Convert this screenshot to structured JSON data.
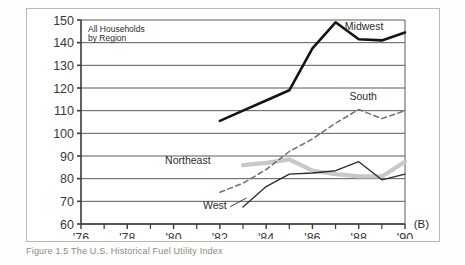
{
  "figure": {
    "panel_label": "(B)",
    "caption": "Figure 1.5    The U.S. Historical Fuel Utility Index",
    "note_line1": "All Households",
    "note_line2": "by Region"
  },
  "chart_data": {
    "type": "line",
    "xlabel": "Year",
    "ylabel": "",
    "xlim": [
      1976,
      1990
    ],
    "ylim": [
      60,
      150
    ],
    "ytick_values": [
      60,
      70,
      80,
      90,
      100,
      110,
      120,
      130,
      140,
      150
    ],
    "ytick_labels": [
      "60",
      "70",
      "80",
      "90",
      "100",
      "110",
      "120",
      "130",
      "140",
      "150"
    ],
    "xtick_values": [
      1976,
      1978,
      1980,
      1982,
      1984,
      1986,
      1988,
      1990
    ],
    "xtick_labels": [
      "'76",
      "'78",
      "'80",
      "'82",
      "'84",
      "'86",
      "'88",
      "'90"
    ],
    "xtick_minor": [
      1977,
      1979,
      1981,
      1983,
      1985,
      1987,
      1989
    ],
    "grid": "horizontal",
    "legend": "inline-labels",
    "series": [
      {
        "name": "Midwest",
        "style": "solid-thick-black",
        "color": "#141414",
        "label_x": 1987.4,
        "label_y": 145.5,
        "x": [
          1982,
          1983,
          1984,
          1985,
          1986,
          1987,
          1988,
          1989,
          1990
        ],
        "y": [
          105.5,
          110.0,
          114.5,
          119.0,
          137.5,
          149.0,
          141.5,
          141.0,
          144.5
        ]
      },
      {
        "name": "South",
        "style": "dashed-gray",
        "color": "#6f6f6f",
        "label_x": 1987.6,
        "label_y": 114.5,
        "x": [
          1982,
          1983,
          1984,
          1985,
          1986,
          1987,
          1988,
          1989,
          1990
        ],
        "y": [
          74.0,
          78.0,
          84.0,
          92.0,
          97.5,
          104.5,
          110.5,
          106.5,
          110.0
        ]
      },
      {
        "name": "Northeast",
        "style": "solid-thick-lightgray",
        "color": "#c8c8c8",
        "label_x": 1981.6,
        "label_y": 86.5,
        "x": [
          1983,
          1984,
          1985,
          1986,
          1987,
          1988,
          1989,
          1990
        ],
        "y": [
          86.0,
          87.0,
          88.5,
          83.5,
          82.0,
          81.0,
          81.0,
          87.5
        ]
      },
      {
        "name": "West",
        "style": "solid-thin-black",
        "color": "#2a2a2a",
        "label_x": 1982.3,
        "label_y": 66.5,
        "x": [
          1983,
          1984,
          1985,
          1986,
          1987,
          1988,
          1989,
          1990
        ],
        "y": [
          67.5,
          76.5,
          82.0,
          82.5,
          83.5,
          87.5,
          79.5,
          82.0
        ]
      }
    ]
  }
}
